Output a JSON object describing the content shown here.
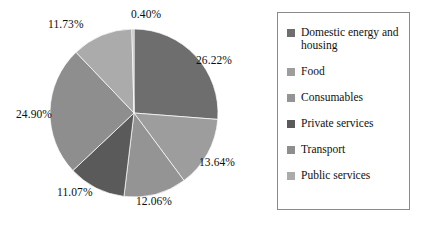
{
  "chart_data": {
    "type": "pie",
    "title": "",
    "legend_position": "right",
    "start_angle_deg": 0,
    "direction": "clockwise",
    "categories": [
      "Domestic energy and housing",
      "Food",
      "Consumables",
      "Private services",
      "Transport",
      "Public services"
    ],
    "values": [
      26.22,
      13.64,
      12.06,
      11.07,
      24.9,
      11.73
    ],
    "unit": "%",
    "slices": [
      {
        "label": "Domestic energy and housing",
        "value": 26.22,
        "display": "26.22%",
        "color": "#6e6e6e",
        "label_x": 196,
        "label_y": 54
      },
      {
        "label": "Food",
        "value": 13.64,
        "display": "13.64%",
        "color": "#9d9d9d",
        "label_x": 199,
        "label_y": 156
      },
      {
        "label": "Consumables",
        "value": 12.06,
        "display": "12.06%",
        "color": "#949494",
        "label_x": 136,
        "label_y": 195
      },
      {
        "label": "Private services",
        "value": 11.07,
        "display": "11.07%",
        "color": "#5a5a5a",
        "label_x": 57,
        "label_y": 186
      },
      {
        "label": "Transport",
        "value": 24.9,
        "display": "24.90%",
        "color": "#8e8e8e",
        "label_x": 16,
        "label_y": 108
      },
      {
        "label": "Public services",
        "value": 11.73,
        "display": "11.73%",
        "color": "#ababab",
        "label_x": 48,
        "label_y": 18
      },
      {
        "label": "",
        "value": 0.4,
        "display": "0.40%",
        "color": "#b8b8b8",
        "label_x": 131,
        "label_y": 8
      }
    ],
    "unlabeled_slice_display": "0.40%",
    "geometry": {
      "center_x": 134,
      "center_y": 113,
      "radius": 84
    },
    "legend_entries": [
      {
        "label": "Domestic energy and housing",
        "color": "#6e6e6e"
      },
      {
        "label": "Food",
        "color": "#9d9d9d"
      },
      {
        "label": "Consumables",
        "color": "#949494"
      },
      {
        "label": "Private services",
        "color": "#5a5a5a"
      },
      {
        "label": "Transport",
        "color": "#8e8e8e"
      },
      {
        "label": "Public services",
        "color": "#ababab"
      }
    ]
  },
  "styles": {
    "background": "#ffffff",
    "legend_border": "#8a8a8a",
    "text_color": "#111111",
    "slice_edge": "#ffffff"
  }
}
